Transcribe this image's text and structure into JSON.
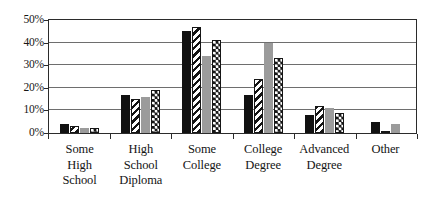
{
  "chart_data": {
    "type": "bar",
    "title": "",
    "subtitle": "",
    "xlabel": "",
    "ylabel": "",
    "ylim": [
      0,
      50
    ],
    "ytick_labels": [
      "50%",
      "40%",
      "30%",
      "20%",
      "10%",
      "0%"
    ],
    "ytick_values": [
      50,
      40,
      30,
      20,
      10,
      0
    ],
    "grid": true,
    "grid_axis": "y",
    "legend": false,
    "legend_position": "none",
    "value_unit": "percent",
    "categories": [
      "Some High School",
      "High School Diploma",
      "Some College",
      "College Degree",
      "Advanced Degree",
      "Other"
    ],
    "category_label_lines": [
      [
        "Some",
        "High",
        "School"
      ],
      [
        "High",
        "School",
        "Diploma"
      ],
      [
        "Some",
        "College"
      ],
      [
        "College",
        "Degree"
      ],
      [
        "Advanced",
        "Degree"
      ],
      [
        "Other"
      ]
    ],
    "series": [
      {
        "name": "Series 1",
        "pattern": "solid-black",
        "color": "#111111",
        "values": [
          4,
          17,
          45,
          17,
          8,
          5
        ]
      },
      {
        "name": "Series 2",
        "pattern": "diagonal-stripe",
        "color": "#141414",
        "values": [
          3,
          15,
          47,
          24,
          12,
          1
        ]
      },
      {
        "name": "Series 3",
        "pattern": "solid-gray",
        "color": "#9b9b9b",
        "values": [
          2,
          16,
          34,
          40,
          11,
          4
        ]
      },
      {
        "name": "Series 4",
        "pattern": "checkerboard",
        "color": "#141414",
        "values": [
          2,
          19,
          41,
          33,
          9,
          0
        ]
      }
    ]
  },
  "style": {
    "plot_border_color": "#2b2b2b",
    "gridline_color": "#6e6e6e",
    "background": "#ffffff",
    "text_color": "#141414"
  }
}
